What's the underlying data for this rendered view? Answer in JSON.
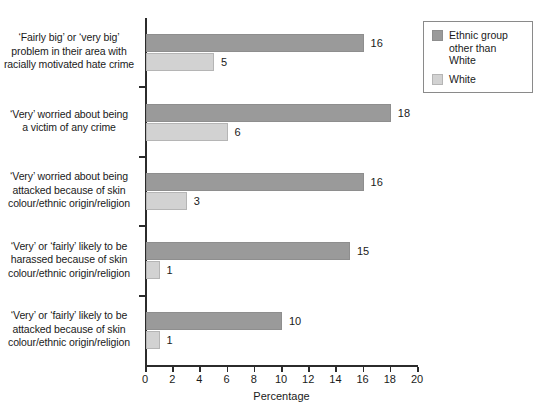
{
  "chart_data": {
    "type": "bar",
    "orientation": "horizontal",
    "title": "",
    "xlabel": "Percentage",
    "ylabel": "",
    "xlim": [
      0,
      20
    ],
    "xticks": [
      0,
      2,
      4,
      6,
      8,
      10,
      12,
      14,
      16,
      18,
      20
    ],
    "grid": false,
    "legend_position": "top-right",
    "categories": [
      "‘Fairly big’ or ‘very big’ problem in their area with racially motivated hate crime",
      "‘Very’ worried about being a victim of any crime",
      "‘Very’ worried about being attacked because of skin colour/ethnic origin/religion",
      "‘Very’ or ‘fairly’ likely to be harassed because of skin colour/ethnic origin/religion",
      "‘Very’ or ‘fairly’ likely to be attacked because of skin colour/ethnic origin/religion"
    ],
    "category_lines": [
      [
        "‘Fairly big’ or ‘very big’",
        "problem in their area with",
        "racially motivated hate crime"
      ],
      [
        "‘Very’ worried about being",
        "a victim of any crime"
      ],
      [
        "‘Very’ worried about being",
        "attacked because of skin",
        "colour/ethnic origin/religion"
      ],
      [
        "‘Very’ or ‘fairly’ likely to be",
        "harassed because of skin",
        "colour/ethnic origin/religion"
      ],
      [
        "‘Very’ or ‘fairly’ likely to be",
        "attacked because of skin",
        "colour/ethnic origin/religion"
      ]
    ],
    "series": [
      {
        "name": "Ethnic group other than White",
        "color": "#9a9a9a",
        "values": [
          16,
          18,
          16,
          15,
          10
        ]
      },
      {
        "name": "White",
        "color": "#d2d2d2",
        "values": [
          5,
          6,
          3,
          1,
          1
        ]
      }
    ]
  },
  "legend": {
    "entries": [
      {
        "label_lines": [
          "Ethnic group",
          "other than White"
        ],
        "label": "Ethnic group other than White",
        "swatch": "dark"
      },
      {
        "label_lines": [
          "White"
        ],
        "label": "White",
        "swatch": "light"
      }
    ]
  },
  "axis": {
    "x_title": "Percentage",
    "x_tick_labels": [
      "0",
      "2",
      "4",
      "6",
      "8",
      "10",
      "12",
      "14",
      "16",
      "18",
      "20"
    ]
  }
}
